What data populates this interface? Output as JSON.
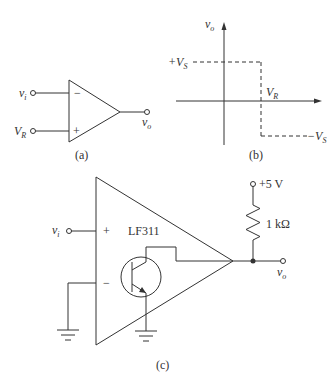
{
  "figure": {
    "panel_a": {
      "caption": "(a)",
      "inputs": {
        "inverting": {
          "label": "v",
          "sub": "i",
          "sign": "−"
        },
        "noninverting": {
          "label": "V",
          "sub": "R",
          "sign": "+"
        }
      },
      "output": {
        "label": "v",
        "sub": "o"
      }
    },
    "panel_b": {
      "caption": "(b)",
      "y_axis": {
        "label": "v",
        "sub": "o"
      },
      "high_level": {
        "label": "+V",
        "sub": "S"
      },
      "low_level": {
        "label": "−V",
        "sub": "S"
      },
      "threshold": {
        "label": "V",
        "sub": "R"
      }
    },
    "panel_c": {
      "caption": "(c)",
      "ic_label": "LF311",
      "input": {
        "label": "v",
        "sub": "i"
      },
      "plus_sign": "+",
      "minus_sign": "−",
      "supply": "+5 V",
      "resistor": "1 kΩ",
      "output": {
        "label": "v",
        "sub": "o"
      }
    }
  },
  "colors": {
    "stroke": "#333333",
    "background": "#ffffff"
  }
}
